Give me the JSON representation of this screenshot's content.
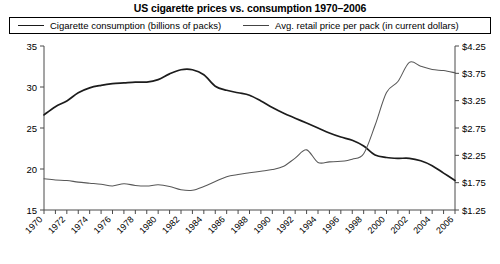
{
  "chart_data": {
    "type": "line",
    "title": "US cigarette prices vs. consumption 1970–2006",
    "xlabel": "",
    "ylabel": "",
    "grid": false,
    "legend_position": "top",
    "x": [
      1970,
      1971,
      1972,
      1973,
      1974,
      1975,
      1976,
      1977,
      1978,
      1979,
      1980,
      1981,
      1982,
      1983,
      1984,
      1985,
      1986,
      1987,
      1988,
      1989,
      1990,
      1991,
      1992,
      1993,
      1994,
      1995,
      1996,
      1997,
      1998,
      1999,
      2000,
      2001,
      2002,
      2003,
      2004,
      2005,
      2006
    ],
    "xtick_labels": [
      "1970",
      "1972",
      "1974",
      "1976",
      "1978",
      "1980",
      "1982",
      "1984",
      "1986",
      "1988",
      "1990",
      "1992",
      "1994",
      "1996",
      "1998",
      "2000",
      "2002",
      "2004",
      "2006"
    ],
    "left_axis": {
      "label": "Cigarette consumption (billions of packs)",
      "ticks": [
        "35",
        "30",
        "25",
        "20",
        "15"
      ],
      "ylim": [
        15,
        35
      ]
    },
    "right_axis": {
      "label": "Avg. retail price per pack (in current dollars)",
      "ticks": [
        "$4.25",
        "$3.75",
        "$3.25",
        "$2.75",
        "$2.25",
        "$1.75",
        "$1.25"
      ],
      "ylim": [
        1.25,
        4.25
      ]
    },
    "series": [
      {
        "name": "Cigarette consumption (billions of packs)",
        "axis": "left",
        "color": "#1c1c1c",
        "values": [
          26.6,
          27.6,
          28.3,
          29.3,
          29.9,
          30.2,
          30.4,
          30.5,
          30.6,
          30.6,
          30.9,
          31.6,
          32.1,
          32.1,
          31.5,
          30.1,
          29.6,
          29.3,
          29.0,
          28.3,
          27.5,
          26.8,
          26.2,
          25.6,
          25.0,
          24.4,
          23.9,
          23.5,
          22.8,
          21.7,
          21.4,
          21.3,
          21.3,
          21.0,
          20.4,
          19.5,
          18.6
        ]
      },
      {
        "name": "Avg. retail price per pack (in current dollars)",
        "axis": "right",
        "color": "#585858",
        "values": [
          1.82,
          1.8,
          1.79,
          1.76,
          1.74,
          1.72,
          1.69,
          1.73,
          1.7,
          1.69,
          1.71,
          1.68,
          1.62,
          1.61,
          1.68,
          1.77,
          1.86,
          1.9,
          1.93,
          1.96,
          1.99,
          2.05,
          2.2,
          2.35,
          2.12,
          2.13,
          2.14,
          2.18,
          2.28,
          2.8,
          3.4,
          3.6,
          3.95,
          3.88,
          3.82,
          3.8,
          3.76
        ]
      }
    ]
  }
}
